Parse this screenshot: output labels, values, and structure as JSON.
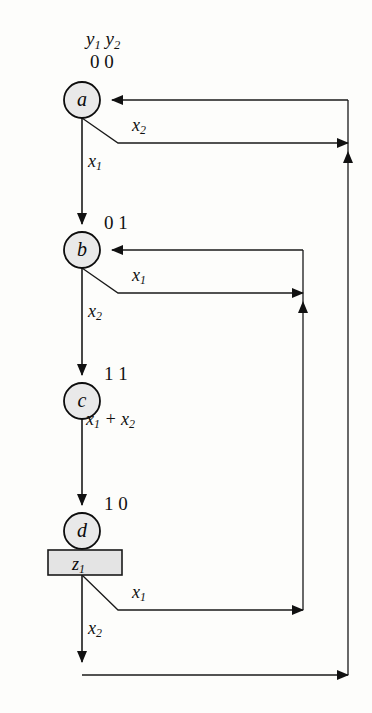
{
  "diagram": {
    "type": "state-transition-diagram",
    "title": "",
    "state_variable_header": {
      "y1": "y",
      "y1_sub": "1",
      "y2": "y",
      "y2_sub": "2",
      "text": "y1 y2"
    },
    "states": [
      {
        "id": "a",
        "letter": "a",
        "code": "0  0",
        "cx": 82,
        "cy": 100,
        "r": 18
      },
      {
        "id": "b",
        "letter": "b",
        "code": "0 1",
        "cx": 82,
        "cy": 250,
        "r": 18
      },
      {
        "id": "c",
        "letter": "c",
        "code": "1 1",
        "cx": 82,
        "cy": 401,
        "r": 18
      },
      {
        "id": "d",
        "letter": "d",
        "code": "1 0",
        "cx": 82,
        "cy": 531,
        "r": 18
      }
    ],
    "output_box": {
      "label": "z",
      "label_sub": "1",
      "text": "z1",
      "x": 48,
      "y": 550,
      "w": 74,
      "h": 25,
      "fill": "#e4e4e4",
      "stroke": "#1a1a1a"
    },
    "transition_labels": [
      {
        "id": "a-x2",
        "base": "x",
        "sub": "2",
        "x": 132,
        "y": 128
      },
      {
        "id": "a-x1",
        "base": "x",
        "sub": "1",
        "x": 88,
        "y": 163
      },
      {
        "id": "b-x1",
        "base": "x",
        "sub": "1",
        "x": 132,
        "y": 278
      },
      {
        "id": "b-x2",
        "base": "x",
        "sub": "2",
        "x": 88,
        "y": 313
      },
      {
        "id": "c-sum",
        "base": "x",
        "sub": "1",
        "base2": "x",
        "sub2": "2",
        "plus": "+",
        "x": 86,
        "y": 421
      },
      {
        "id": "d-x1",
        "base": "x",
        "sub": "1",
        "x": 132,
        "y": 595
      },
      {
        "id": "d-x2",
        "base": "x",
        "sub": "2",
        "x": 88,
        "y": 630
      }
    ],
    "colors": {
      "state_fill": "#e9e9e9",
      "state_stroke": "#0d0d0d",
      "line": "#1a1a1a",
      "background": "#fdfdfb",
      "box_fill": "#e4e4e4"
    },
    "feedback_lines": {
      "inner_x": 303,
      "outer_x": 348
    }
  }
}
